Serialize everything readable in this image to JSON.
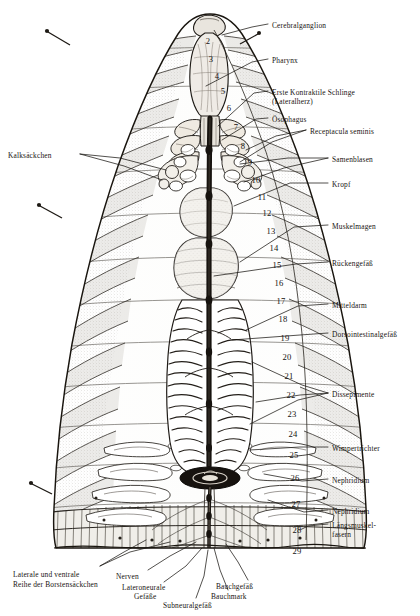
{
  "figure": {
    "kind": "anatomical-plate",
    "background_color": "#ffffff",
    "ink_color": "#1a1713"
  },
  "labels_right": [
    {
      "id": "cerebralganglion",
      "text": "Cerebralganglion",
      "x": 272,
      "y": 21
    },
    {
      "id": "pharynx",
      "text": "Pharynx",
      "x": 272,
      "y": 56
    },
    {
      "id": "erste-kontraktile-schlinge",
      "text": "Erste Kontraktile Schlinge",
      "x": 272,
      "y": 88
    },
    {
      "id": "lateralherz",
      "text": "(Lateralherz)",
      "x": 272,
      "y": 97
    },
    {
      "id": "oesophagus",
      "text": "Ösophagus",
      "x": 272,
      "y": 115
    },
    {
      "id": "receptacula-seminis",
      "text": "Receptacula seminis",
      "x": 310,
      "y": 127
    },
    {
      "id": "samenblasen",
      "text": "Samenblasen",
      "x": 332,
      "y": 155
    },
    {
      "id": "kropf",
      "text": "Kropf",
      "x": 332,
      "y": 180
    },
    {
      "id": "muskelmagen",
      "text": "Muskelmagen",
      "x": 332,
      "y": 222
    },
    {
      "id": "rueckengefaess",
      "text": "Rückengefäß",
      "x": 332,
      "y": 259
    },
    {
      "id": "mitteldarm",
      "text": "Mitteldarm",
      "x": 332,
      "y": 301
    },
    {
      "id": "dorsointestinalgefaess",
      "text": "Dorsointestinalgefäß",
      "x": 332,
      "y": 330
    },
    {
      "id": "dissepimente",
      "text": "Dissepimente",
      "x": 332,
      "y": 390
    },
    {
      "id": "wimpertrichter",
      "text": "Wimpertrichter",
      "x": 332,
      "y": 444
    },
    {
      "id": "nephridium-1",
      "text": "Nephridium",
      "x": 332,
      "y": 476
    },
    {
      "id": "nephridium-2",
      "text": "Nephridium",
      "x": 332,
      "y": 507
    },
    {
      "id": "laengsmuskelfasern-1",
      "text": "Längsmuskel-",
      "x": 332,
      "y": 521
    },
    {
      "id": "laengsmuskelfasern-2",
      "text": "fasern",
      "x": 332,
      "y": 530
    }
  ],
  "labels_left": [
    {
      "id": "kalksaeckchen",
      "text": "Kalksäckchen",
      "x": 8,
      "y": 151
    }
  ],
  "labels_bottom": [
    {
      "id": "laterale-ventrale-reihe-1",
      "text": "Laterale und ventrale",
      "x": 13,
      "y": 570
    },
    {
      "id": "laterale-ventrale-reihe-2",
      "text": "Reihe der Borstensäckchen",
      "x": 13,
      "y": 580
    },
    {
      "id": "nerven",
      "text": "Nerven",
      "x": 116,
      "y": 572
    },
    {
      "id": "lateroneurale-1",
      "text": "Lateroneurale",
      "x": 122,
      "y": 583
    },
    {
      "id": "lateroneurale-2",
      "text": "Gefäße",
      "x": 134,
      "y": 592
    },
    {
      "id": "subneuralgefaess",
      "text": "Subneuralgefäß",
      "x": 163,
      "y": 601
    },
    {
      "id": "bauchmark",
      "text": "Bauchmark",
      "x": 211,
      "y": 592
    },
    {
      "id": "bauchgefaess",
      "text": "Bauchgefäß",
      "x": 216,
      "y": 582
    }
  ],
  "segment_numbers": [
    {
      "n": "2",
      "x": 208,
      "y": 36
    },
    {
      "n": "3",
      "x": 211,
      "y": 54
    },
    {
      "n": "4",
      "x": 217,
      "y": 71
    },
    {
      "n": "5",
      "x": 223,
      "y": 86
    },
    {
      "n": "6",
      "x": 229,
      "y": 103
    },
    {
      "n": "7",
      "x": 236,
      "y": 122
    },
    {
      "n": "8",
      "x": 243,
      "y": 141
    },
    {
      "n": "9",
      "x": 250,
      "y": 157
    },
    {
      "n": "10",
      "x": 256,
      "y": 175
    },
    {
      "n": "11",
      "x": 262,
      "y": 192
    },
    {
      "n": "12",
      "x": 267,
      "y": 208
    },
    {
      "n": "13",
      "x": 271,
      "y": 226
    },
    {
      "n": "14",
      "x": 274,
      "y": 243
    },
    {
      "n": "15",
      "x": 277,
      "y": 260
    },
    {
      "n": "16",
      "x": 279,
      "y": 278
    },
    {
      "n": "17",
      "x": 281,
      "y": 296
    },
    {
      "n": "18",
      "x": 283,
      "y": 314
    },
    {
      "n": "19",
      "x": 285,
      "y": 333
    },
    {
      "n": "20",
      "x": 287,
      "y": 352
    },
    {
      "n": "21",
      "x": 289,
      "y": 371
    },
    {
      "n": "22",
      "x": 291,
      "y": 390
    },
    {
      "n": "23",
      "x": 292,
      "y": 409
    },
    {
      "n": "24",
      "x": 293,
      "y": 429
    },
    {
      "n": "25",
      "x": 294,
      "y": 450
    },
    {
      "n": "26",
      "x": 295,
      "y": 473
    },
    {
      "n": "27",
      "x": 296,
      "y": 499
    },
    {
      "n": "28",
      "x": 297,
      "y": 525
    },
    {
      "n": "29",
      "x": 297,
      "y": 546
    }
  ]
}
